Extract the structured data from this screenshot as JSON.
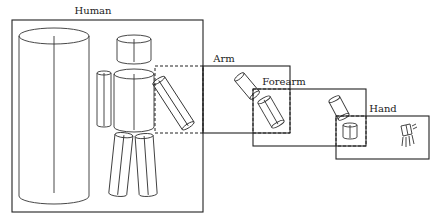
{
  "diagram": {
    "type": "nested-hierarchy",
    "panels": [
      {
        "id": "human",
        "label": "Human"
      },
      {
        "id": "arm",
        "label": "Arm"
      },
      {
        "id": "forearm",
        "label": "Forearm"
      },
      {
        "id": "hand",
        "label": "Hand"
      }
    ],
    "relationships": [
      {
        "from": "human",
        "to": "arm",
        "style": "dashed-zoom-box"
      },
      {
        "from": "arm",
        "to": "forearm",
        "style": "dashed-zoom-box"
      },
      {
        "from": "forearm",
        "to": "hand",
        "style": "dashed-zoom-box"
      }
    ],
    "colors": {
      "stroke": "#222222",
      "background": "#ffffff"
    }
  }
}
